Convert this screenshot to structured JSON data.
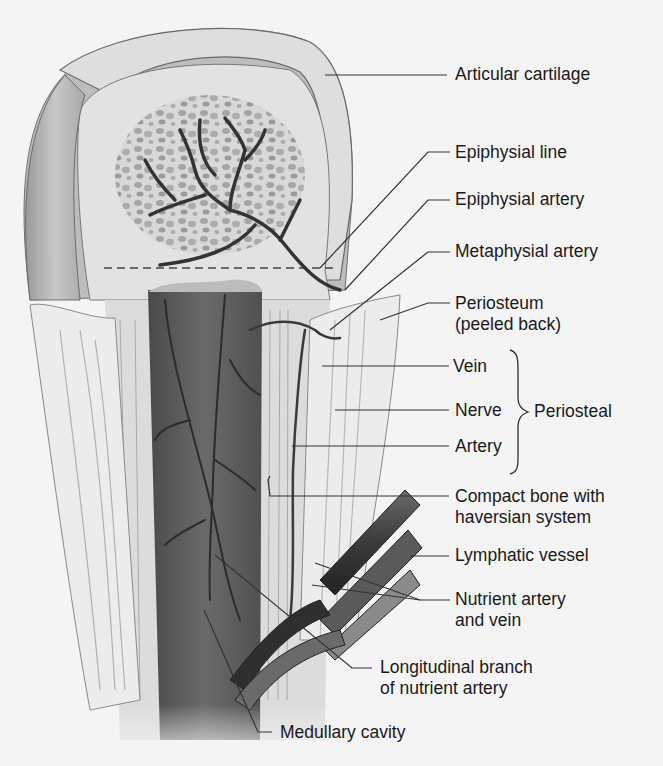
{
  "figure": {
    "background_color": "#f4f4f4",
    "label_color": "#1a1a1a",
    "leader_color": "#333333"
  },
  "labels": {
    "articular_cartilage": "Articular cartilage",
    "epiphysial_line": "Epiphysial line",
    "epiphysial_artery": "Epiphysial artery",
    "metaphysial_artery": "Metaphysial artery",
    "periosteum_1": "Periosteum",
    "periosteum_2": "(peeled back)",
    "vein": "Vein",
    "nerve": "Nerve",
    "artery": "Artery",
    "periosteal_group": "Periosteal",
    "compact_bone_1": "Compact bone with",
    "compact_bone_2": "haversian system",
    "lymphatic_vessel": "Lymphatic vessel",
    "nutrient_1": "Nutrient artery",
    "nutrient_2": "and vein",
    "longitudinal_1": "Longitudinal branch",
    "longitudinal_2": "of nutrient artery",
    "medullary_cavity": "Medullary cavity"
  }
}
